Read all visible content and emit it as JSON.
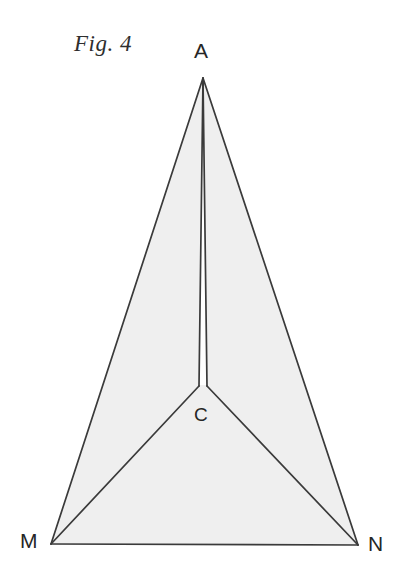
{
  "figure": {
    "caption": "Fig. 4",
    "background_color": "#ffffff",
    "fill_color": "#efefef",
    "stroke_color": "#3a3a3a",
    "stroke_width": 1.7,
    "canvas": {
      "width": 406,
      "height": 580
    }
  },
  "labels": {
    "apex": "A",
    "center": "C",
    "left_base": "M",
    "right_base": "N"
  },
  "chart_data": {
    "type": "diagram",
    "title": "Fig. 4",
    "points": [
      {
        "name": "A",
        "x": 203,
        "y": 78
      },
      {
        "name": "C",
        "x": 203,
        "y": 387
      },
      {
        "name": "M",
        "x": 51,
        "y": 544
      },
      {
        "name": "N",
        "x": 358,
        "y": 545
      }
    ],
    "wedge": {
      "apex": {
        "x": 203,
        "y": 78
      },
      "left_base": {
        "x": 199,
        "y": 385
      },
      "right_base": {
        "x": 207,
        "y": 385
      },
      "fill": "#ffffff"
    },
    "polygons": [
      {
        "name": "shaded-body",
        "vertices": [
          "M",
          "A",
          "N"
        ],
        "fill": "#efefef",
        "stroke": "#3a3a3a"
      }
    ],
    "segments": [
      {
        "from": "M",
        "to": "A"
      },
      {
        "from": "A",
        "to": "N"
      },
      {
        "from": "M",
        "to": "N"
      },
      {
        "from": "M",
        "to": "C"
      },
      {
        "from": "C",
        "to": "N"
      },
      {
        "from": "A",
        "to": "C",
        "style": "narrow-wedge"
      }
    ],
    "xlabel": "",
    "ylabel": "",
    "grid": false,
    "legend": false
  }
}
